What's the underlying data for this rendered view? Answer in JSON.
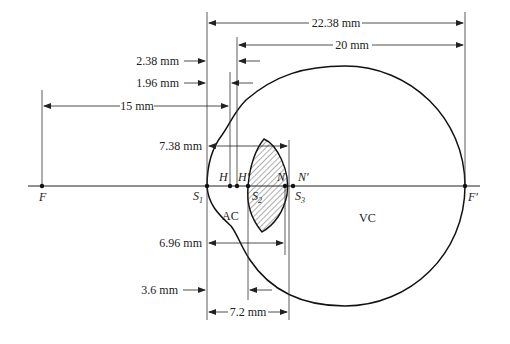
{
  "diagram": {
    "dimensions": {
      "d_22_38": "22.38 mm",
      "d_20": "20 mm",
      "d_2_38": "2.38 mm",
      "d_1_96": "1.96 mm",
      "d_15": "15 mm",
      "d_7_38": "7.38 mm",
      "d_6_96": "6.96 mm",
      "d_3_6": "3.6 mm",
      "d_7_2": "7.2 mm"
    },
    "points": {
      "F": "F",
      "F_prime": "F′",
      "H": "H",
      "H_prime": "H′",
      "N": "N",
      "N_prime": "N′",
      "S1": "S",
      "S1_sub": "1",
      "S2": "S",
      "S2_sub": "2",
      "S3": "S",
      "S3_sub": "3"
    },
    "regions": {
      "AC": "AC",
      "VC": "VC"
    },
    "colors": {
      "line": "#222222",
      "background": "#ffffff"
    }
  }
}
